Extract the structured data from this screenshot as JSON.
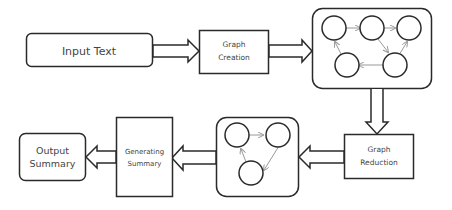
{
  "diagram": {
    "type": "flowchart",
    "nodes": {
      "input_text": {
        "label": "Input Text"
      },
      "graph_creation": {
        "line1": "Graph",
        "line2": "Creation"
      },
      "full_graph": {
        "node_count": 5,
        "edges": 5
      },
      "graph_reduction": {
        "line1": "Graph",
        "line2": "Reduction"
      },
      "reduced_graph": {
        "node_count": 3,
        "edges": 3
      },
      "generating_summary": {
        "line1": "Generating",
        "line2": "Summary"
      },
      "output_summary": {
        "line1": "Output",
        "line2": "Summary"
      }
    },
    "flow": [
      "Input Text",
      "Graph Creation",
      "Full Graph",
      "Graph Reduction",
      "Reduced Graph",
      "Generating Summary",
      "Output Summary"
    ],
    "colors": {
      "stroke": "#2a2a2a",
      "text": "#444444",
      "edge": "#999999",
      "background": "#ffffff"
    }
  }
}
